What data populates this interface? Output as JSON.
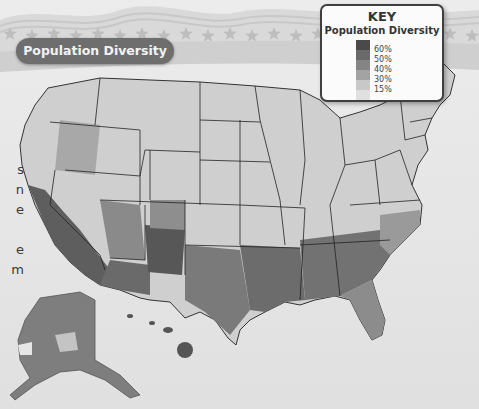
{
  "title": "Population Diversity",
  "key": {
    "title": "KEY",
    "subtitle": "Population Diversity",
    "levels": [
      {
        "label": "60%",
        "color": "#4a4a4a"
      },
      {
        "label": "50%",
        "color": "#6a6a6a"
      },
      {
        "label": "40%",
        "color": "#858585"
      },
      {
        "label": "30%",
        "color": "#a3a3a3"
      },
      {
        "label": "15%",
        "color": "#c8c8c8"
      },
      {
        "label": "",
        "color": "#e0e0e0"
      }
    ]
  },
  "edge_text_fragments": [
    "s",
    "n",
    "e",
    "",
    "e",
    "m"
  ],
  "colors": {
    "title_pill": "#6e6e6e",
    "state_border": "#222222",
    "land_light": "#d8d8d8",
    "land_dark": "#555555"
  }
}
